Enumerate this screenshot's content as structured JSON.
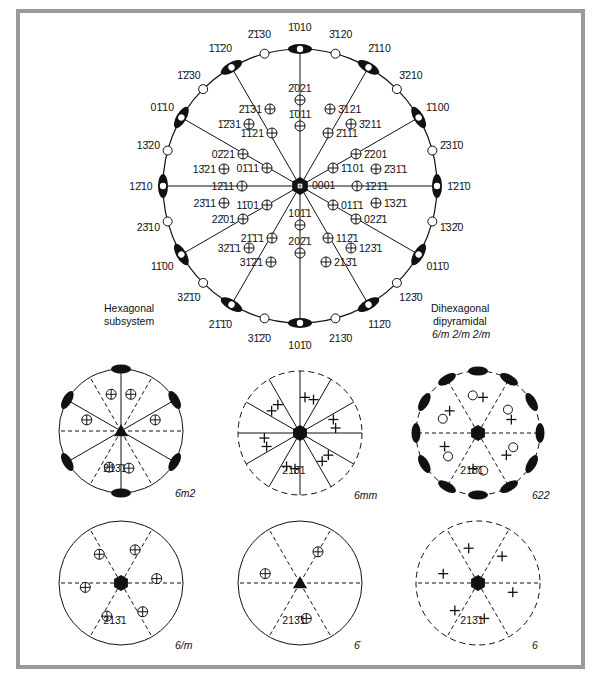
{
  "figure": {
    "main": {
      "title_left": [
        "Hexagonal",
        "subsystem"
      ],
      "title_right": [
        "Dihexagonal",
        "dipyramidal",
        "6/m 2/m 2/m"
      ],
      "center_label": "0001",
      "rim_forms_major": [
        {
          "label": "1̄010",
          "angle": 90
        },
        {
          "label": "2̄110",
          "angle": 60
        },
        {
          "label": "1̄100",
          "angle": 30
        },
        {
          "label": "1̄21̄0",
          "angle": 0
        },
        {
          "label": "011̄0",
          "angle": -30
        },
        {
          "label": "112̄0",
          "angle": -60
        },
        {
          "label": "101̄0",
          "angle": -90
        },
        {
          "label": "21̄1̄0",
          "angle": -120
        },
        {
          "label": "11̄00",
          "angle": -150
        },
        {
          "label": "12̄10",
          "angle": 180
        },
        {
          "label": "01̄10",
          "angle": 150
        },
        {
          "label": "1̄1̄20",
          "angle": 120
        }
      ],
      "rim_forms_minor": [
        {
          "label": "3̄120",
          "angle": 75
        },
        {
          "label": "3̄210",
          "angle": 45
        },
        {
          "label": "2̄31̄0",
          "angle": 15
        },
        {
          "label": "1̄32̄0",
          "angle": -15
        },
        {
          "label": "123̄0",
          "angle": -45
        },
        {
          "label": "213̄0",
          "angle": -75
        },
        {
          "label": "31̄2̄0",
          "angle": -105
        },
        {
          "label": "32̄1̄0",
          "angle": -135
        },
        {
          "label": "23̄10",
          "angle": -165
        },
        {
          "label": "13̄20",
          "angle": 165
        },
        {
          "label": "1̄2̄30",
          "angle": 135
        },
        {
          "label": "2̄1̄30",
          "angle": 105
        }
      ],
      "inner_poles": [
        {
          "label": "2̄021",
          "x": 300,
          "y": 100
        },
        {
          "label": "2̄1̄31",
          "x": 270,
          "y": 109
        },
        {
          "label": "3̄121",
          "x": 330,
          "y": 109
        },
        {
          "label": "1̄011",
          "x": 300,
          "y": 126
        },
        {
          "label": "1̄1̄21",
          "x": 272,
          "y": 133
        },
        {
          "label": "2̄111",
          "x": 328,
          "y": 133
        },
        {
          "label": "1̄2̄31",
          "x": 249,
          "y": 124
        },
        {
          "label": "3̄211",
          "x": 351,
          "y": 124
        },
        {
          "label": "02̄21",
          "x": 243,
          "y": 154
        },
        {
          "label": "2̄201",
          "x": 356,
          "y": 154
        },
        {
          "label": "01̄11",
          "x": 267,
          "y": 168
        },
        {
          "label": "1̄101",
          "x": 333,
          "y": 168
        },
        {
          "label": "13̄21",
          "x": 224,
          "y": 169
        },
        {
          "label": "2̄31̄1",
          "x": 376,
          "y": 169
        },
        {
          "label": "12̄11",
          "x": 242,
          "y": 186
        },
        {
          "label": "1̄21̄1",
          "x": 357,
          "y": 186
        },
        {
          "label": "23̄11",
          "x": 224,
          "y": 203
        },
        {
          "label": "1̄32̄1",
          "x": 376,
          "y": 203
        },
        {
          "label": "11̄01",
          "x": 267,
          "y": 205
        },
        {
          "label": "011̄1",
          "x": 333,
          "y": 205
        },
        {
          "label": "22̄01",
          "x": 243,
          "y": 219
        },
        {
          "label": "022̄1",
          "x": 356,
          "y": 219
        },
        {
          "label": "21̄1̄1",
          "x": 272,
          "y": 238
        },
        {
          "label": "112̄1",
          "x": 328,
          "y": 238
        },
        {
          "label": "101̄1",
          "x": 300,
          "y": 225
        },
        {
          "label": "32̄1̄1",
          "x": 249,
          "y": 248
        },
        {
          "label": "123̄1",
          "x": 351,
          "y": 248
        },
        {
          "label": "31̄2̄1",
          "x": 271,
          "y": 262
        },
        {
          "label": "202̄1",
          "x": 300,
          "y": 253
        },
        {
          "label": "213̄1",
          "x": 326,
          "y": 262
        }
      ]
    },
    "subfigures": [
      {
        "name": "6bar-m2",
        "symbol": "6̄m2",
        "pole_label": "213̄1"
      },
      {
        "name": "6mm",
        "symbol": "6mm",
        "pole_label": "213̄1"
      },
      {
        "name": "622",
        "symbol": "622",
        "pole_label": "213̄1"
      },
      {
        "name": "6-over-m",
        "symbol": "6/m",
        "pole_label": "213̄1"
      },
      {
        "name": "6bar",
        "symbol": "6̄",
        "pole_label": "213̄1"
      },
      {
        "name": "6",
        "symbol": "6",
        "pole_label": "213̄1"
      }
    ],
    "colors": {
      "frame": "#9a9a9a",
      "ink": "#111111",
      "background": "#ffffff"
    }
  }
}
